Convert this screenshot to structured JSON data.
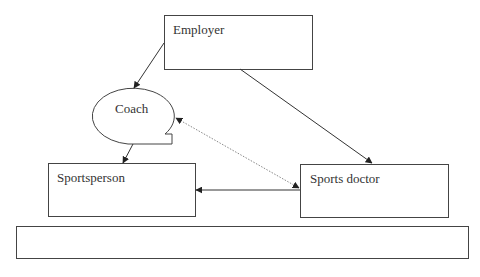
{
  "diagram": {
    "type": "relationship-diagram",
    "nodes": [
      {
        "id": "employer",
        "label": "Employer",
        "shape": "rectangle"
      },
      {
        "id": "coach",
        "label": "Coach",
        "shape": "ellipse-callout"
      },
      {
        "id": "sportsperson",
        "label": "Sportsperson",
        "shape": "rectangle"
      },
      {
        "id": "sports_doctor",
        "label": "Sports doctor",
        "shape": "rectangle"
      },
      {
        "id": "bottom_bar",
        "label": "",
        "shape": "rectangle"
      }
    ],
    "edges": [
      {
        "from": "employer",
        "to": "coach",
        "style": "solid",
        "arrow": "end"
      },
      {
        "from": "employer",
        "to": "sports_doctor",
        "style": "solid",
        "arrow": "end"
      },
      {
        "from": "coach",
        "to": "sportsperson",
        "style": "solid",
        "arrow": "end"
      },
      {
        "from": "sports_doctor",
        "to": "sportsperson",
        "style": "solid",
        "arrow": "end"
      },
      {
        "from": "sports_doctor",
        "to": "coach",
        "style": "dotted",
        "arrow": "both"
      }
    ],
    "colors": {
      "stroke": "#444444",
      "dotted_stroke": "#888888",
      "text": "#333333",
      "background": "#ffffff"
    }
  }
}
